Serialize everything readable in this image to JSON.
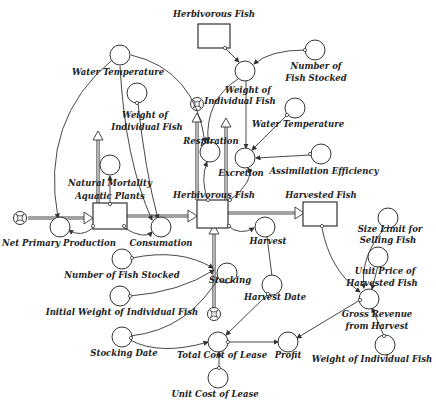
{
  "diagram": {
    "type": "stock-and-flow",
    "background": "#ffffff",
    "stroke_color": "#333333",
    "stocks": [
      {
        "id": "herbivorous_fish_top",
        "label": "Herbivorous Fish"
      },
      {
        "id": "aquatic_plants",
        "label": "Aquatic Plants"
      },
      {
        "id": "herbivorous_fish",
        "label": "Herbivorous Fish"
      },
      {
        "id": "harvested_fish",
        "label": "Harvested Fish"
      }
    ],
    "flows": [
      {
        "id": "net_primary_production",
        "label": "Net Primary Production"
      },
      {
        "id": "natural_mortality",
        "label": "Natural Mortality"
      },
      {
        "id": "consumation",
        "label": "Consumation"
      },
      {
        "id": "respiration",
        "label": "Respiration"
      },
      {
        "id": "excretion",
        "label": "Excretion"
      },
      {
        "id": "harvest",
        "label": "Harvest"
      },
      {
        "id": "stocking",
        "label": "Stocking"
      }
    ],
    "converters": {
      "water_temperature_1": "Water Temperature",
      "weight_indiv_fish_top_l1": "Weight of",
      "weight_indiv_fish_top_l2": "Individual Fish",
      "number_fish_stocked_top_l1": "Number of",
      "number_fish_stocked_top_l2": "Fish Stocked",
      "water_temperature_2": "Water Temperature",
      "weight_indiv_fish_left_l1": "Weight of",
      "weight_indiv_fish_left_l2": "Individual Fish",
      "assimilation_efficiency": "Assimilation Efficiency",
      "size_limit_l1": "Size Limit for",
      "size_limit_l2": "Selling Fish",
      "unit_price_l1": "Unit Price of",
      "unit_price_l2": "Harvested Fish",
      "gross_revenue_l1": "Gross Revenue",
      "gross_revenue_l2": "from Harvest",
      "weight_indiv_fish_bottom": "Weight of Individual Fish",
      "number_fish_stocked_bottom": "Number of Fish Stocked",
      "initial_weight": "Initial Weight of Individual Fish",
      "harvest_date": "Harvest Date",
      "stocking_date": "Stocking Date",
      "total_cost_of_lease": "Total Cost of Lease",
      "profit": "Profit",
      "unit_cost_of_lease": "Unit Cost of Lease"
    },
    "labels": {
      "herbivorous_fish_top": "Herbivorous Fish",
      "natural_mortality": "Natural Mortality",
      "aquatic_plants": "Aquatic Plants",
      "net_primary_production": "Net Primary Production",
      "consumation": "Consumation",
      "respiration": "Respiration",
      "excretion": "Excretion",
      "herbivorous_fish": "Herbivorous Fish",
      "harvested_fish": "Harvested Fish",
      "harvest": "Harvest",
      "stocking": "Stocking"
    }
  }
}
